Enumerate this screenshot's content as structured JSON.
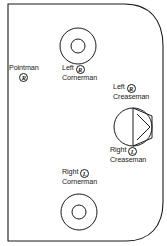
{
  "diagram": {
    "stroke_color": "#1a1a1a",
    "field_color": "#ffffff",
    "positions": [
      {
        "id": "pointman",
        "name": "Pointman",
        "line1": "Pointman",
        "hand": "R",
        "hand_label": "right-handed"
      },
      {
        "id": "left-cornerman",
        "name": "Left Cornerman",
        "line1": "Left",
        "line2": "Cornerman",
        "hand": "R",
        "hand_label": "right-handed"
      },
      {
        "id": "left-creaseman",
        "name": "Left Creaseman",
        "line1": "Left",
        "line2": "Creaseman",
        "hand": "R",
        "hand_label": "right-handed"
      },
      {
        "id": "right-creaseman",
        "name": "Right Creaseman",
        "line1": "Right",
        "line2": "Creaseman",
        "hand": "L",
        "hand_label": "left-handed"
      },
      {
        "id": "right-cornerman",
        "name": "Right Cornerman",
        "line1": "Right",
        "line2": "Cornerman",
        "hand": "L",
        "hand_label": "left-handed"
      }
    ],
    "markings": [
      {
        "id": "top-circle",
        "type": "concentric-circles"
      },
      {
        "id": "bottom-circle",
        "type": "concentric-circles"
      },
      {
        "id": "goal-crease",
        "type": "crease-and-goal"
      }
    ]
  }
}
